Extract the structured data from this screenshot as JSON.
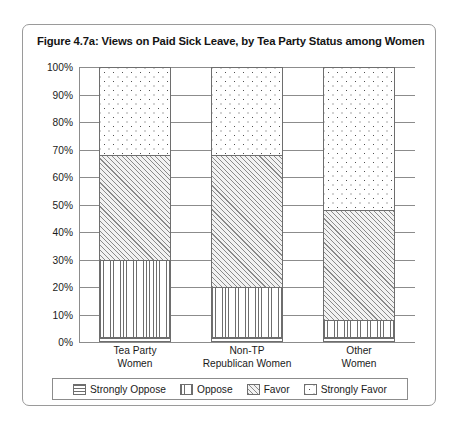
{
  "figure": {
    "title": "Figure 4.7a: Views on Paid Sick Leave, by Tea Party Status among Women"
  },
  "chart_data": {
    "type": "bar",
    "subtype": "stacked-100-percent",
    "title": "Figure 4.7a: Views on Paid Sick Leave, by Tea Party Status among Women",
    "xlabel": "",
    "ylabel": "",
    "ylim": [
      0,
      100
    ],
    "yticks": [
      0,
      10,
      20,
      30,
      40,
      50,
      60,
      70,
      80,
      90,
      100
    ],
    "ytick_labels": [
      "0%",
      "10%",
      "20%",
      "30%",
      "40%",
      "50%",
      "60%",
      "70%",
      "80%",
      "90%",
      "100%"
    ],
    "grid": true,
    "legend_position": "bottom",
    "categories": [
      "Tea Party\nWomen",
      "Non-TP\nRepublican Women",
      "Other\nWomen"
    ],
    "category_lines": [
      [
        "Tea Party",
        "Women"
      ],
      [
        "Non-TP",
        "Republican Women"
      ],
      [
        "Other",
        "Women"
      ]
    ],
    "series": [
      {
        "name": "Strongly Oppose",
        "pattern": "horizontal-lines",
        "values": [
          2,
          2,
          2
        ]
      },
      {
        "name": "Oppose",
        "pattern": "vertical-lines",
        "values": [
          28,
          18,
          6
        ]
      },
      {
        "name": "Favor",
        "pattern": "diagonal-hatch",
        "values": [
          38,
          48,
          40
        ]
      },
      {
        "name": "Strongly Favor",
        "pattern": "dots",
        "values": [
          32,
          32,
          52
        ]
      }
    ]
  },
  "legend": {
    "items": [
      {
        "label": "Strongly Oppose"
      },
      {
        "label": "Oppose"
      },
      {
        "label": "Favor"
      },
      {
        "label": "Strongly Favor"
      }
    ]
  }
}
